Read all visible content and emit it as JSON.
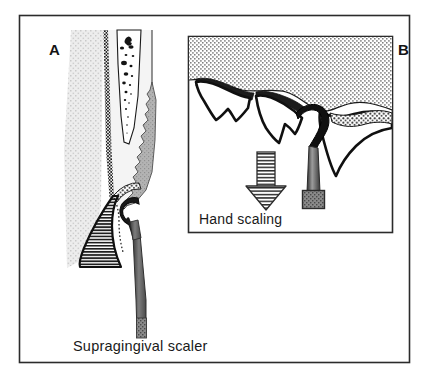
{
  "figure": {
    "type": "medical-illustration",
    "background_color": "#ffffff",
    "outer_frame": {
      "name": "figure-border",
      "stroke_color": "#2b2b2b",
      "x": 19,
      "y": 15,
      "width": 391,
      "height": 348
    }
  },
  "panel_a": {
    "letter": "A",
    "caption": "Supragingival scaler",
    "description": "Cross-section of tooth root, periodontal tissue and gingiva with a supragingival scaler engaging calculus at the gingival margin",
    "colors": {
      "bone_stipple": "#e6e6e6",
      "tooth_body": "#f2f2f2",
      "calculus_gray": "#b0b0b0",
      "pulp_white": "#ffffff",
      "pulp_specks": "#1a1a1a",
      "gingiva_hatch": "#262626",
      "instrument_gray": "#6e6e6e",
      "outline": "#111111"
    },
    "structures": [
      "alveolar-bone",
      "periodontal-ligament",
      "tooth-root",
      "pulp-canal",
      "subgingival-calculus",
      "gingiva",
      "scaler-instrument"
    ]
  },
  "panel_b": {
    "letter": "B",
    "caption": "Hand scaling",
    "description": "Interproximal view of two teeth with gingival tissue above; curette inserted into interdental space, arrow indicating downward stroke direction",
    "frame": {
      "x": 188,
      "y": 36,
      "width": 205,
      "height": 197,
      "stroke_color": "#2b2b2b",
      "fill": "#ffffff"
    },
    "colors": {
      "gingiva_stipple": "#f0f0f0",
      "tooth_white": "#ffffff",
      "calculus_dark": "#1c1c1c",
      "outline": "#101010",
      "arrow_fill": "#f2f2f2",
      "arrow_hatch": "#2b2b2b",
      "handle_gray": "#7a7a7a"
    },
    "arrow": {
      "name": "stroke-direction-arrow",
      "direction": "down"
    },
    "structures": [
      "gingival-tissue",
      "tooth-left",
      "tooth-center",
      "tooth-right",
      "interproximal-calculus",
      "curette-blade",
      "curette-shank",
      "instrument-handle",
      "direction-arrow"
    ]
  }
}
